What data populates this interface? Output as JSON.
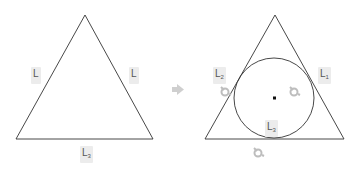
{
  "diagram": {
    "left_triangle": {
      "labels": [
        {
          "id": "left",
          "text": "L",
          "sub": ""
        },
        {
          "id": "right",
          "text": "L",
          "sub": ""
        },
        {
          "id": "bottom",
          "text": "L",
          "sub": "3"
        }
      ]
    },
    "arrow": {
      "icon": "right-arrow-icon",
      "color": "#c8c8c8"
    },
    "right_triangle": {
      "labels": [
        {
          "id": "left",
          "text": "L",
          "sub": "2"
        },
        {
          "id": "right",
          "text": "L",
          "sub": "1"
        },
        {
          "id": "bottom",
          "text": "L",
          "sub": "3"
        }
      ],
      "incircle": {
        "center_marker": "dot"
      },
      "markers": [
        "eye-icon",
        "eye-icon",
        "eye-icon"
      ]
    },
    "colors": {
      "stroke": "#333333",
      "label_bg": "#ececec",
      "marker": "#bdbdbd"
    }
  }
}
